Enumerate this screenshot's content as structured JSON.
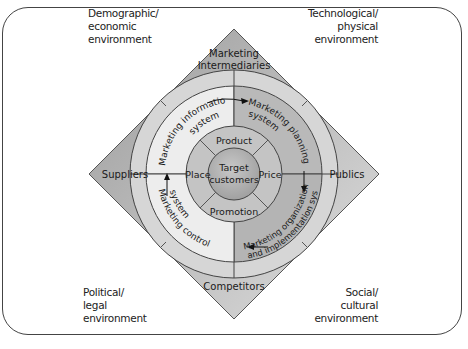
{
  "environments": {
    "top_left": [
      "Demographic/",
      "economic",
      "environment"
    ],
    "top_right": [
      "Technological/",
      "physical",
      "environment"
    ],
    "bottom_left": [
      "Political/",
      "legal",
      "environment"
    ],
    "bottom_right": [
      "Social/",
      "cultural",
      "environment"
    ]
  },
  "actors": {
    "top": [
      "Marketing",
      "Intermediaries"
    ],
    "left": "Suppliers",
    "right": "Publics",
    "bottom": "Competitors"
  },
  "systems": {
    "information": [
      "Marketing information",
      "system"
    ],
    "planning": [
      "Marketing planning",
      "system"
    ],
    "organization": [
      "Marketing organization",
      "and implementation system"
    ],
    "control": [
      "Marketing control",
      "system"
    ]
  },
  "marketing_mix": {
    "top": "Product",
    "right": "Price",
    "bottom": "Promotion",
    "left": "Place"
  },
  "center": [
    "Target",
    "customers"
  ],
  "colors": {
    "diamond_dark": "#a9a9a9",
    "diamond_light": "#d4d4d4",
    "ring_light": "#ececec",
    "ring_dark": "#b8b8b8",
    "mix_ring": "#c2c2c2",
    "center": "#b0b0b0"
  }
}
